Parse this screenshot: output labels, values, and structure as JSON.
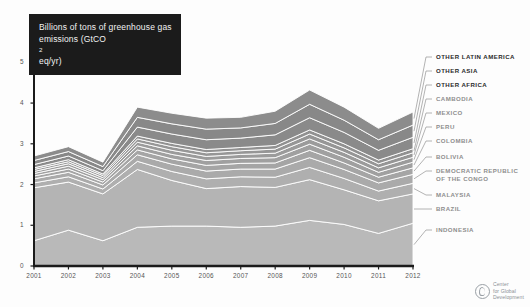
{
  "title": {
    "line1": "Billions of tons of greenhouse gas",
    "line2_pre": "emissions (GtCO",
    "line2_sub": "2",
    "line2_post": "eq/yr)",
    "full": "Billions of tons of greenhouse gas emissions (GtCO2eq/yr)"
  },
  "logo": {
    "line1": "Center",
    "line2": "for Global",
    "line3": "Development",
    "icon": "cgd-circle-logo"
  },
  "colors": {
    "background": "#fdfdfd",
    "title_bg": "#1b1b1b",
    "title_fg": "#f2f2f2",
    "axis": "#1b1b1b",
    "legend_dark": "#2a2a2a",
    "legend_light": "#8d8d8d",
    "leader": "#9a9a9a",
    "band_separator": "#ffffff"
  },
  "chart_data": {
    "type": "area",
    "stacked": true,
    "title": "Billions of tons of greenhouse gas emissions (GtCO2eq/yr)",
    "xlabel": "",
    "ylabel": "",
    "grid": false,
    "legend_position": "right",
    "xlim": [
      2001,
      2012
    ],
    "ylim": [
      0,
      5
    ],
    "yticks": [
      0,
      1,
      2,
      3,
      4,
      5
    ],
    "ytick_labels": [
      "0",
      "1",
      "2",
      "3",
      "4",
      "5"
    ],
    "x": [
      2001,
      2002,
      2003,
      2004,
      2005,
      2006,
      2007,
      2008,
      2009,
      2010,
      2011,
      2012
    ],
    "xtick_labels": [
      "2001",
      "2002",
      "2003",
      "2004",
      "2005",
      "2006",
      "2007",
      "2008",
      "2009",
      "2010",
      "2011",
      "2012"
    ],
    "series": [
      {
        "name": "INDONESIA",
        "color": "#b9b9b9",
        "tone": "light",
        "values": [
          0.62,
          0.88,
          0.62,
          0.95,
          0.98,
          0.98,
          0.95,
          0.98,
          1.12,
          1.02,
          0.8,
          1.05
        ]
      },
      {
        "name": "BRAZIL",
        "color": "#b4b4b4",
        "tone": "light",
        "values": [
          1.3,
          1.18,
          1.15,
          1.42,
          1.12,
          0.92,
          1.0,
          0.95,
          1.0,
          0.85,
          0.8,
          0.72
        ]
      },
      {
        "name": "MALAYSIA",
        "color": "#afafaf",
        "tone": "light",
        "values": [
          0.12,
          0.13,
          0.12,
          0.2,
          0.22,
          0.24,
          0.24,
          0.25,
          0.3,
          0.28,
          0.24,
          0.26
        ]
      },
      {
        "name": "DEMOCRATIC REPUBLIC OF THE CONGO",
        "color": "#aaaaaa",
        "tone": "light",
        "values": [
          0.1,
          0.11,
          0.1,
          0.16,
          0.18,
          0.19,
          0.19,
          0.2,
          0.24,
          0.22,
          0.2,
          0.22
        ]
      },
      {
        "name": "BOLIVIA",
        "color": "#a5a5a5",
        "tone": "light",
        "values": [
          0.07,
          0.08,
          0.07,
          0.12,
          0.13,
          0.14,
          0.14,
          0.15,
          0.18,
          0.16,
          0.14,
          0.16
        ]
      },
      {
        "name": "COLOMBIA",
        "color": "#a0a0a0",
        "tone": "light",
        "values": [
          0.06,
          0.07,
          0.06,
          0.1,
          0.11,
          0.12,
          0.12,
          0.13,
          0.15,
          0.14,
          0.12,
          0.14
        ]
      },
      {
        "name": "PERU",
        "color": "#9b9b9b",
        "tone": "light",
        "values": [
          0.05,
          0.06,
          0.05,
          0.09,
          0.1,
          0.1,
          0.1,
          0.11,
          0.13,
          0.12,
          0.11,
          0.12
        ]
      },
      {
        "name": "MEXICO",
        "color": "#969696",
        "tone": "light",
        "values": [
          0.05,
          0.05,
          0.05,
          0.08,
          0.09,
          0.09,
          0.09,
          0.1,
          0.12,
          0.11,
          0.1,
          0.11
        ]
      },
      {
        "name": "CAMBODIA",
        "color": "#919191",
        "tone": "light",
        "values": [
          0.04,
          0.05,
          0.04,
          0.07,
          0.08,
          0.08,
          0.08,
          0.09,
          0.1,
          0.1,
          0.09,
          0.1
        ]
      },
      {
        "name": "OTHER AFRICA",
        "color": "#8a8a8a",
        "tone": "dark",
        "values": [
          0.08,
          0.09,
          0.08,
          0.22,
          0.23,
          0.24,
          0.23,
          0.26,
          0.3,
          0.28,
          0.24,
          0.28
        ]
      },
      {
        "name": "OTHER ASIA",
        "color": "#888888",
        "tone": "dark",
        "values": [
          0.1,
          0.11,
          0.1,
          0.24,
          0.25,
          0.26,
          0.25,
          0.28,
          0.33,
          0.3,
          0.26,
          0.3
        ]
      },
      {
        "name": "OTHER LATIN AMERICA",
        "color": "#8c8c8c",
        "tone": "dark",
        "values": [
          0.11,
          0.12,
          0.11,
          0.25,
          0.26,
          0.27,
          0.26,
          0.3,
          0.35,
          0.32,
          0.28,
          0.32
        ]
      }
    ],
    "totals": [
      2.7,
      2.93,
      2.55,
      3.9,
      3.75,
      3.63,
      3.65,
      3.8,
      4.32,
      3.9,
      3.38,
      3.78
    ]
  },
  "legend": {
    "items": [
      {
        "label": "OTHER LATIN AMERICA",
        "tone": "dark"
      },
      {
        "label": "OTHER ASIA",
        "tone": "dark"
      },
      {
        "label": "OTHER AFRICA",
        "tone": "dark"
      },
      {
        "label": "CAMBODIA",
        "tone": "light"
      },
      {
        "label": "MEXICO",
        "tone": "light"
      },
      {
        "label": "PERU",
        "tone": "light"
      },
      {
        "label": "COLOMBIA",
        "tone": "light"
      },
      {
        "label": "BOLIVIA",
        "tone": "light"
      },
      {
        "label": "DEMOCRATIC REPUBLIC",
        "label2": "OF THE CONGO",
        "tone": "light"
      },
      {
        "label": "MALAYSIA",
        "tone": "light"
      },
      {
        "label": "BRAZIL",
        "tone": "light"
      },
      {
        "label": "INDONESIA",
        "tone": "light"
      }
    ]
  }
}
